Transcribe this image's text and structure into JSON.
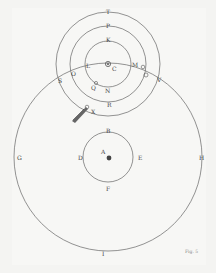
{
  "diagram": {
    "type": "astronomical-orbits-engraving",
    "labels": {
      "T": "T",
      "P": "P",
      "K": "K",
      "C": "C",
      "S": "S",
      "O": "O",
      "L": "L",
      "M": "M",
      "V": "V",
      "Q": "Q",
      "N": "N",
      "R": "R",
      "X": "X",
      "B": "B",
      "D": "D",
      "E": "E",
      "F": "F",
      "A": "A",
      "G": "G",
      "H": "H",
      "I": "I"
    },
    "figure_caption": "Fig. 5"
  },
  "colors": {
    "background": "#f7f7f5",
    "ink": "#555555"
  }
}
